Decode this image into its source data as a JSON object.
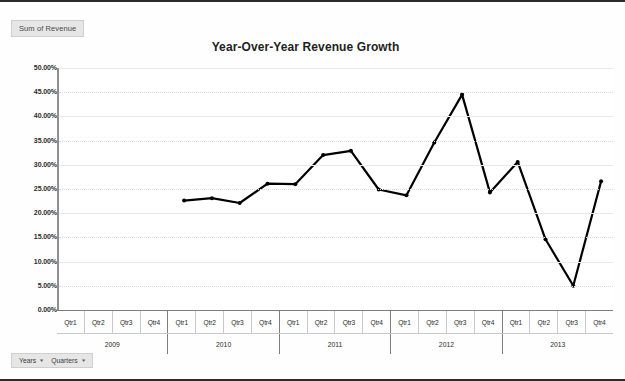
{
  "window": {
    "field_button_label": "Sum of Revenue"
  },
  "chart_data": {
    "type": "line",
    "title": "Year-Over-Year Revenue Growth",
    "xlabel": "",
    "ylabel": "",
    "ylim": [
      0,
      50
    ],
    "ytick_labels": [
      "50.00%",
      "45.00%",
      "40.00%",
      "35.00%",
      "30.00%",
      "25.00%",
      "20.00%",
      "15.00%",
      "10.00%",
      "5.00%",
      "0.00%"
    ],
    "ytick_values": [
      50,
      45,
      40,
      35,
      30,
      25,
      20,
      15,
      10,
      5,
      0
    ],
    "grid": true,
    "legend": "none",
    "marker": "round",
    "line_color": "#000000",
    "years": [
      "2009",
      "2010",
      "2011",
      "2012",
      "2013"
    ],
    "quarters": [
      "Qtr1",
      "Qtr2",
      "Qtr3",
      "Qtr4"
    ],
    "categories": [
      "2009 Qtr1",
      "2009 Qtr2",
      "2009 Qtr3",
      "2009 Qtr4",
      "2010 Qtr1",
      "2010 Qtr2",
      "2010 Qtr3",
      "2010 Qtr4",
      "2011 Qtr1",
      "2011 Qtr2",
      "2011 Qtr3",
      "2011 Qtr4",
      "2012 Qtr1",
      "2012 Qtr2",
      "2012 Qtr3",
      "2012 Qtr4",
      "2013 Qtr1",
      "2013 Qtr2",
      "2013 Qtr3",
      "2013 Qtr4"
    ],
    "series": [
      {
        "name": "Sum of Revenue",
        "values": [
          null,
          null,
          null,
          null,
          22.6,
          23.1,
          22.1,
          26.1,
          26.0,
          32.0,
          32.9,
          24.9,
          23.7,
          34.6,
          44.5,
          24.3,
          30.6,
          14.6,
          5.0,
          26.6
        ]
      }
    ]
  },
  "footer": {
    "years_button": "Years",
    "quarters_button": "Quarters",
    "caret_glyph": "▾"
  }
}
